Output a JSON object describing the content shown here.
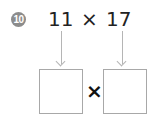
{
  "problem": {
    "number": "10",
    "left_operand": "11",
    "operator": "×",
    "right_operand": "17",
    "answer_operator": "×",
    "answer_boxes": [
      "",
      ""
    ]
  },
  "colors": {
    "badge": "#8c8c8c",
    "text": "#222222",
    "arrow": "#b5b5b5",
    "box_border": "#a8a8a8"
  }
}
